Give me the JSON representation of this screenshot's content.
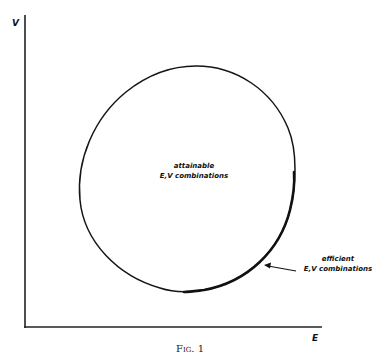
{
  "figure": {
    "caption": "Fig. 1",
    "axes": {
      "y_label": "V",
      "x_label": "E"
    },
    "region_label": {
      "line1": "attainable",
      "line2": "E,V combinations"
    },
    "efficient_label": {
      "line1": "efficient",
      "line2": "E,V combinations"
    },
    "colors": {
      "ink": "#111111",
      "background": "#ffffff"
    }
  }
}
